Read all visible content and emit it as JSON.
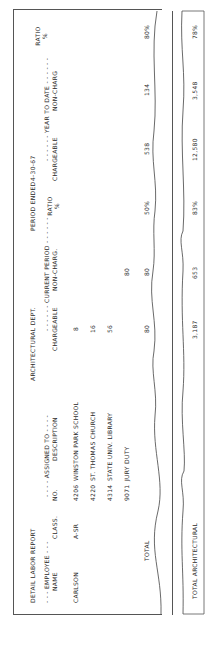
{
  "report": {
    "title": "DETAIL LABOR REPORT",
    "department": "ARCHITECTURAL DEPT.",
    "period_label": "PERIOD ENDED",
    "period_date": "4-30-67",
    "group_headers": {
      "employee": "- - - EMPLOYEE - - -",
      "assigned_to": "- - - - ASSIGNED TO - - - -",
      "current_period": "- - - - - - CURRENT PERIOD - - - - - -",
      "year_to_date": "- - - - - - YEAR TO DATE - - - - - -"
    },
    "columns": {
      "name": "NAME",
      "class": "CLASS.",
      "no": "NO.",
      "description": "DESCRIPTION",
      "chargeable": "CHARGEABLE",
      "non_charg": "NON-CHARG.",
      "ratio": "RATIO",
      "ratio_unit": "%",
      "ytd_chargeable": "CHARGEABLE",
      "ytd_non_charg": "NON-CHARG",
      "ytd_ratio": "RATIO",
      "ytd_ratio_unit": "%"
    },
    "employee": {
      "name": "CARLSON",
      "class": "A-SR"
    },
    "rows": [
      {
        "no": "4206",
        "description": "WINSTON PARK SCHOOL",
        "chargeable": "8",
        "non_charg": ""
      },
      {
        "no": "4220",
        "description": "ST. THOMAS CHURCH",
        "chargeable": "16",
        "non_charg": ""
      },
      {
        "no": "4314",
        "description": "STATE UNIV. LIBRARY",
        "chargeable": "56",
        "non_charg": ""
      },
      {
        "no": "9071",
        "description": "JURY DUTY",
        "chargeable": "",
        "non_charg": "80"
      }
    ],
    "total": {
      "label": "TOTAL",
      "chargeable": "80",
      "non_charg": "80",
      "ratio": "50%",
      "ytd_chargeable": "538",
      "ytd_non_charg": "134",
      "ytd_ratio": "80%"
    },
    "grand_total": {
      "label": "TOTAL ARCHITECTURAL",
      "chargeable": "3,187",
      "non_charg": "653",
      "ratio": "83%",
      "ytd_chargeable": "12,580",
      "ytd_non_charg": "3,548",
      "ytd_ratio": "78%"
    }
  }
}
